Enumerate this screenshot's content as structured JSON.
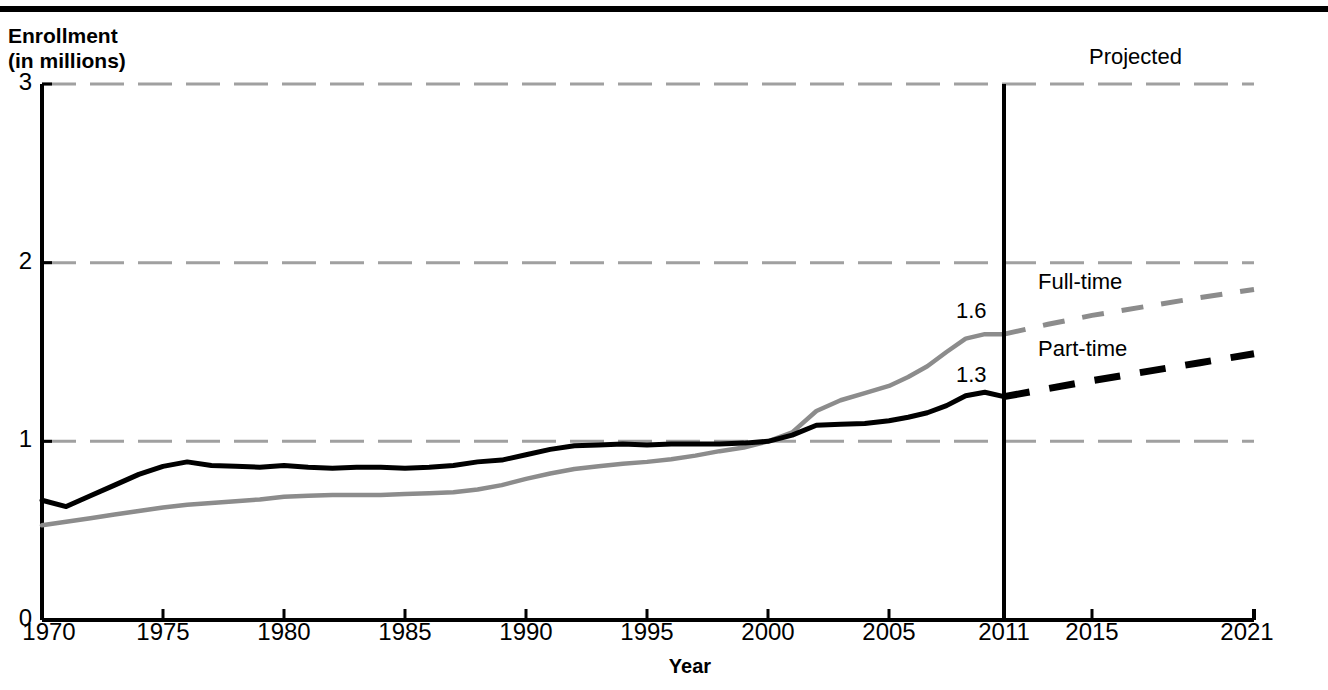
{
  "header": {
    "rule": "top-rule"
  },
  "chart_data": {
    "type": "line",
    "title": "",
    "ylabel_line1": "Enrollment",
    "ylabel_line2": "(in millions)",
    "xlabel": "Year",
    "xlim": [
      1970,
      2021
    ],
    "ylim": [
      0,
      3
    ],
    "yticks": [
      "0",
      "1",
      "2",
      "3"
    ],
    "ytick_values": [
      0,
      1,
      2,
      3
    ],
    "xticks": [
      "1970",
      "1975",
      "1980",
      "1985",
      "1990",
      "1995",
      "2000",
      "2005",
      "2011",
      "2015",
      "2021"
    ],
    "xtick_values": [
      1970,
      1975,
      1980,
      1985,
      1990,
      1995,
      2000,
      2005,
      2011,
      2015,
      2021
    ],
    "grid": true,
    "grid_style": "dashed",
    "grid_color": "#a0a0a0",
    "legend": "inline-labels",
    "projection_divider_year": 2011,
    "projection_label": "Projected",
    "annotations": [
      {
        "text": "1.6",
        "series": "Full-time",
        "year": 2011,
        "value": 1.6
      },
      {
        "text": "1.3",
        "series": "Part-time",
        "year": 2011,
        "value": 1.3
      }
    ],
    "series": [
      {
        "name": "Full-time",
        "color": "#8c8c8c",
        "label": "Full-time",
        "x": [
          1970,
          1971,
          1972,
          1973,
          1974,
          1975,
          1976,
          1977,
          1978,
          1979,
          1980,
          1981,
          1982,
          1983,
          1984,
          1985,
          1986,
          1987,
          1988,
          1989,
          1990,
          1991,
          1992,
          1993,
          1994,
          1995,
          1996,
          1997,
          1998,
          1999,
          2000,
          2001,
          2002,
          2003,
          2004,
          2005,
          2006,
          2007,
          2008,
          2009,
          2010,
          2011
        ],
        "values": [
          0.53,
          0.55,
          0.57,
          0.59,
          0.61,
          0.63,
          0.645,
          0.655,
          0.665,
          0.675,
          0.69,
          0.695,
          0.7,
          0.7,
          0.7,
          0.705,
          0.71,
          0.715,
          0.73,
          0.755,
          0.79,
          0.82,
          0.845,
          0.86,
          0.875,
          0.885,
          0.9,
          0.92,
          0.945,
          0.965,
          1.0,
          1.05,
          1.17,
          1.23,
          1.27,
          1.31,
          1.36,
          1.42,
          1.5,
          1.575,
          1.6,
          1.6
        ],
        "projected_x": [
          2011,
          2013,
          2015,
          2017,
          2019,
          2021
        ],
        "projected_values": [
          1.6,
          1.655,
          1.705,
          1.755,
          1.805,
          1.85
        ]
      },
      {
        "name": "Part-time",
        "color": "#000000",
        "label": "Part-time",
        "x": [
          1970,
          1971,
          1972,
          1973,
          1974,
          1975,
          1976,
          1977,
          1978,
          1979,
          1980,
          1981,
          1982,
          1983,
          1984,
          1985,
          1986,
          1987,
          1988,
          1989,
          1990,
          1991,
          1992,
          1993,
          1994,
          1995,
          1996,
          1997,
          1998,
          1999,
          2000,
          2001,
          2002,
          2003,
          2004,
          2005,
          2006,
          2007,
          2008,
          2009,
          2010,
          2011
        ],
        "values": [
          0.67,
          0.635,
          0.695,
          0.755,
          0.815,
          0.86,
          0.885,
          0.865,
          0.86,
          0.855,
          0.865,
          0.855,
          0.85,
          0.855,
          0.855,
          0.85,
          0.855,
          0.865,
          0.885,
          0.895,
          0.925,
          0.955,
          0.975,
          0.98,
          0.985,
          0.98,
          0.985,
          0.985,
          0.985,
          0.99,
          1.0,
          1.035,
          1.09,
          1.095,
          1.1,
          1.115,
          1.135,
          1.16,
          1.2,
          1.255,
          1.275,
          1.25
        ],
        "projected_x": [
          2011,
          2013,
          2015,
          2017,
          2019,
          2021
        ],
        "projected_values": [
          1.25,
          1.295,
          1.34,
          1.39,
          1.44,
          1.49
        ]
      }
    ]
  }
}
